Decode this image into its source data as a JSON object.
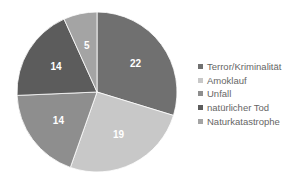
{
  "chart_data": {
    "type": "pie",
    "title": "",
    "categories": [
      "Terror/Kriminalität",
      "Amoklauf",
      "Unfall",
      "natürlicher Tod",
      "Naturkatastrophe"
    ],
    "values": [
      22,
      19,
      14,
      14,
      5
    ],
    "colors": [
      "#707070",
      "#c8c8c8",
      "#8e8e8e",
      "#5c5c5c",
      "#a4a4a4"
    ],
    "data_labels": [
      "22",
      "19",
      "14",
      "14",
      "5"
    ],
    "start_angle": "12 o'clock",
    "direction": "clockwise",
    "legend_position": "right"
  },
  "legend": {
    "items": [
      {
        "label": "Terror/Kriminalität",
        "color": "#707070"
      },
      {
        "label": "Amoklauf",
        "color": "#c8c8c8"
      },
      {
        "label": "Unfall",
        "color": "#8e8e8e"
      },
      {
        "label": "natürlicher Tod",
        "color": "#5c5c5c"
      },
      {
        "label": "Naturkatastrophe",
        "color": "#a4a4a4"
      }
    ]
  }
}
